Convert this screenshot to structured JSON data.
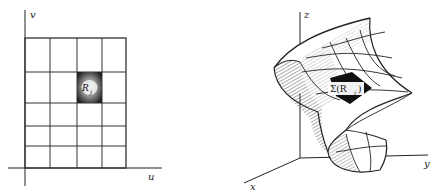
{
  "left_diagram": {
    "axis_labels": {
      "vertical": "v",
      "horizontal": "u"
    },
    "grid": {
      "columns": 4,
      "rows": 5
    },
    "highlighted_cell_label": "R",
    "highlighted_cell_subscript": "j"
  },
  "right_diagram": {
    "axis_labels": {
      "z": "z",
      "y": "y",
      "x": "x"
    },
    "patch_label": "Σ(R",
    "patch_label_subscript": "j",
    "patch_label_close": ")"
  },
  "colors": {
    "ink": "#222222",
    "background": "#ffffff"
  }
}
